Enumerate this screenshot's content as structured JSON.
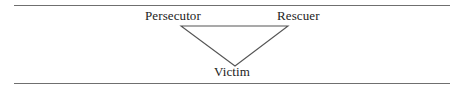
{
  "figure": {
    "name": "drama-triangle",
    "background_color": "#ffffff",
    "line_color": "#555555",
    "rule_color": "#6f6f6f",
    "text_color": "#1c1c1c"
  },
  "rules": {
    "top_label": "",
    "bottom_label": ""
  },
  "diagram": {
    "shape": "inverted-triangle",
    "nodes": [
      {
        "id": "persecutor",
        "label": "Persecutor",
        "position": "top-left"
      },
      {
        "id": "rescuer",
        "label": "Rescuer",
        "position": "top-right"
      },
      {
        "id": "victim",
        "label": "Victim",
        "position": "bottom-apex"
      }
    ],
    "vertices": {
      "top_left": [
        181,
        26
      ],
      "top_right": [
        288,
        26
      ],
      "bottom_apex": [
        235,
        66
      ]
    }
  }
}
